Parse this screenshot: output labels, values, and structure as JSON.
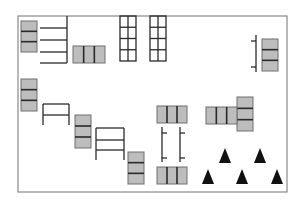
{
  "diagram": {
    "title": "",
    "colors": {
      "background": "#ffffff",
      "frame": "#8a8a8a",
      "line": "#2a2a2a",
      "block_fill": "#bdbdbd",
      "block_border": "#6e6e6e",
      "block_divider": "#2a2a2a",
      "triangle": "#111111"
    },
    "frame": {
      "x": 18,
      "y": 16,
      "w": 269,
      "h": 176
    },
    "vertical_stacks": [
      {
        "id": "stack-a",
        "x": 21,
        "y": 21,
        "w": 16,
        "h": 31,
        "cells": 3
      },
      {
        "id": "stack-right",
        "x": 262,
        "y": 39,
        "w": 16,
        "h": 32,
        "cells": 3
      },
      {
        "id": "stack-b",
        "x": 21,
        "y": 79,
        "w": 16,
        "h": 32,
        "cells": 3
      },
      {
        "id": "stack-c",
        "x": 75,
        "y": 115,
        "w": 16,
        "h": 33,
        "cells": 3
      },
      {
        "id": "stack-d",
        "x": 128,
        "y": 152,
        "w": 16,
        "h": 32,
        "cells": 3
      },
      {
        "id": "stack-h",
        "x": 237,
        "y": 97,
        "w": 16,
        "h": 34,
        "cells": 3
      }
    ],
    "horizontal_triples": [
      {
        "id": "triple-top",
        "x": 73,
        "y": 46,
        "w": 32,
        "h": 17,
        "cells": 3
      },
      {
        "id": "triple-e",
        "x": 157,
        "y": 106,
        "w": 30,
        "h": 17,
        "cells": 3
      },
      {
        "id": "triple-f",
        "x": 157,
        "y": 167,
        "w": 30,
        "h": 17,
        "cells": 3
      },
      {
        "id": "triple-g",
        "x": 206,
        "y": 107,
        "w": 31,
        "h": 17,
        "cells": 3
      }
    ],
    "comb": {
      "x1": 40,
      "x2": 67,
      "y_top": 16,
      "rows": [
        28,
        40,
        52,
        63
      ]
    },
    "grids": [
      {
        "id": "grid-1",
        "x": 120,
        "y": 16,
        "w": 16,
        "h": 45,
        "cols": 2,
        "rows": 4
      },
      {
        "id": "grid-2",
        "x": 150,
        "y": 16,
        "w": 16,
        "h": 45,
        "cols": 2,
        "rows": 4
      }
    ],
    "tables": [
      {
        "id": "table-1",
        "x": 43,
        "y": 104,
        "w": 26,
        "h": 21,
        "rails": [
          115
        ]
      },
      {
        "id": "table-2",
        "x": 96,
        "y": 128,
        "w": 28,
        "h": 32,
        "rails": [
          140,
          150
        ]
      }
    ],
    "brackets": [
      {
        "id": "bracket-right",
        "x": 256,
        "y1": 35,
        "y2": 72,
        "ticks": [
          41,
          67
        ],
        "dir": -1
      },
      {
        "id": "bracket-mid-1",
        "x": 162,
        "y1": 127,
        "y2": 162,
        "ticks": [
          133,
          158
        ],
        "dir": 1
      },
      {
        "id": "bracket-mid-2",
        "x": 180,
        "y1": 127,
        "y2": 162,
        "ticks": [
          133,
          158
        ],
        "dir": 1
      }
    ],
    "triangles": [
      {
        "cx": 225,
        "base_y": 163,
        "size": 12
      },
      {
        "cx": 260,
        "base_y": 163,
        "size": 12
      },
      {
        "cx": 208,
        "base_y": 184,
        "size": 12
      },
      {
        "cx": 242,
        "base_y": 184,
        "size": 12
      },
      {
        "cx": 277,
        "base_y": 184,
        "size": 12
      }
    ]
  }
}
